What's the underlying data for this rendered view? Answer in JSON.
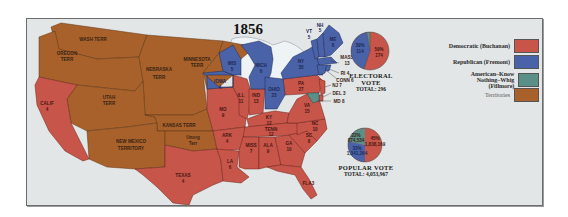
{
  "title": "1856",
  "colors": {
    "democratic": "#c8554a",
    "republican": "#4a62a8",
    "american": "#5a9088",
    "territories": "#a8612a",
    "background": "#e3e6e6",
    "water": "#eef3f6"
  },
  "legend": [
    {
      "label": "Democratic (Buchanan)",
      "color": "#c8554a"
    },
    {
      "label": "Republican (Fremont)",
      "color": "#4a62a8"
    },
    {
      "label": "American–Know Nothing–Whig (Fillmore)",
      "label_line1": "American–Know Nothing–Whig",
      "label_line2": "(Fillmore)",
      "color": "#5a9088"
    },
    {
      "label": "Territories",
      "color": "#a8612a"
    }
  ],
  "territories": [
    {
      "name": "WASH TERR"
    },
    {
      "name": "OREGON TERR",
      "line1": "OREGON",
      "line2": "TERR"
    },
    {
      "name": "MINNESOTA TERR",
      "line1": "MINNESOTA",
      "line2": "TERR"
    },
    {
      "name": "NEBRASKA TERR",
      "line1": "NEBRASKA",
      "line2": "TERR"
    },
    {
      "name": "UTAH TERR",
      "line1": "UTAH",
      "line2": "TERR"
    },
    {
      "name": "KANSAS TERR"
    },
    {
      "name": "NEW MEXICO TERRITORY",
      "line1": "NEW MEXICO",
      "line2": "TERRITORY"
    },
    {
      "name": "Unorg Terr",
      "line1": "Unorg",
      "line2": "Terr"
    }
  ],
  "states": {
    "calif": {
      "abbr": "CALIF",
      "ev": "4",
      "party": "democratic"
    },
    "texas": {
      "abbr": "TEXAS",
      "ev": "4",
      "party": "democratic"
    },
    "iowa": {
      "abbr": "IOWA",
      "ev": "4",
      "party": "republican"
    },
    "wis": {
      "abbr": "WIS",
      "ev": "5",
      "party": "republican"
    },
    "mich": {
      "abbr": "MICH",
      "ev": "6",
      "party": "republican"
    },
    "ill": {
      "abbr": "ILL",
      "ev": "11",
      "party": "democratic"
    },
    "ind": {
      "abbr": "IND",
      "ev": "13",
      "party": "democratic"
    },
    "ohio": {
      "abbr": "OHIO",
      "ev": "23",
      "party": "republican"
    },
    "mo": {
      "abbr": "MO",
      "ev": "9",
      "party": "democratic"
    },
    "ky": {
      "abbr": "KY",
      "ev": "12",
      "party": "democratic"
    },
    "tenn": {
      "abbr": "TENN",
      "ev": "12",
      "party": "democratic"
    },
    "ark": {
      "abbr": "ARK",
      "ev": "4",
      "party": "democratic"
    },
    "la": {
      "abbr": "LA",
      "ev": "6",
      "party": "democratic"
    },
    "miss": {
      "abbr": "MISS",
      "ev": "7",
      "party": "democratic"
    },
    "ala": {
      "abbr": "ALA",
      "ev": "9",
      "party": "democratic"
    },
    "ga": {
      "abbr": "GA",
      "ev": "10",
      "party": "democratic"
    },
    "fla": {
      "abbr": "FLA",
      "ev": "3",
      "party": "democratic"
    },
    "sc": {
      "abbr": "SC",
      "ev": "8",
      "party": "democratic"
    },
    "nc": {
      "abbr": "NC",
      "ev": "10",
      "party": "democratic"
    },
    "va": {
      "abbr": "VA",
      "ev": "15",
      "party": "democratic"
    },
    "pa": {
      "abbr": "PA",
      "ev": "27",
      "party": "democratic"
    },
    "ny": {
      "abbr": "NY",
      "ev": "35",
      "party": "republican"
    },
    "vt": {
      "abbr": "VT",
      "ev": "5",
      "party": "republican"
    },
    "nh": {
      "abbr": "NH",
      "ev": "5",
      "party": "republican"
    },
    "me": {
      "abbr": "ME",
      "ev": "8",
      "party": "republican"
    },
    "mass": {
      "abbr": "MASS",
      "ev": "13",
      "party": "republican"
    },
    "ri": {
      "abbr": "RI",
      "ev": "4",
      "label": "RI 4",
      "party": "republican"
    },
    "conn": {
      "abbr": "CONN",
      "ev": "6",
      "label": "CONN 6",
      "party": "republican"
    },
    "nj": {
      "abbr": "NJ",
      "ev": "7",
      "label": "NJ 7",
      "party": "democratic"
    },
    "del": {
      "abbr": "DEL",
      "ev": "3",
      "label": "DEL 3",
      "party": "democratic"
    },
    "md": {
      "abbr": "MD",
      "ev": "8",
      "label": "MD 8",
      "party": "american"
    }
  },
  "electoral_vote": {
    "caption": "ELECTORAL VOTE",
    "total_label": "TOTAL: 296",
    "total": 296,
    "slices": [
      {
        "party": "Democratic",
        "pct": "59%",
        "votes": "174"
      },
      {
        "party": "Republican",
        "pct": "39%",
        "votes": "114"
      },
      {
        "party": "American",
        "pct": "3%",
        "votes": "8"
      }
    ]
  },
  "popular_vote": {
    "caption": "POPULAR VOTE",
    "total_label": "TOTAL: 4,053,967",
    "total": 4053967,
    "slices": [
      {
        "party": "Democratic",
        "pct": "45%",
        "votes": "1,838,169"
      },
      {
        "party": "Republican",
        "pct": "33%",
        "votes": "1,341,264"
      },
      {
        "party": "American",
        "pct": "22%",
        "votes": "874,534"
      }
    ]
  }
}
